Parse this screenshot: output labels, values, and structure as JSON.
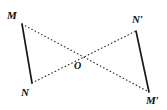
{
  "figure": {
    "background_color": "#ffffff",
    "stroke_color": "#1a1a1a",
    "width": 167,
    "height": 110,
    "labels": {
      "M": "M",
      "N": "N",
      "N_prime": "N′",
      "M_prime": "M′",
      "O": "O"
    },
    "points": {
      "M": {
        "x": 22,
        "y": 24
      },
      "N": {
        "x": 32,
        "y": 83
      },
      "N_prime": {
        "x": 136,
        "y": 31
      },
      "M_prime": {
        "x": 149,
        "y": 92
      },
      "O": {
        "x": 83,
        "y": 56
      }
    },
    "segments": [
      {
        "name": "segment-MN",
        "from": "M",
        "to": "N",
        "style": "solid",
        "width": 1.6
      },
      {
        "name": "segment-NpMp",
        "from": "N_prime",
        "to": "M_prime",
        "style": "solid",
        "width": 1.6
      },
      {
        "name": "segment-MMp",
        "from": "M",
        "to": "M_prime",
        "style": "dotted",
        "width": 1.1
      },
      {
        "name": "segment-NNp",
        "from": "N",
        "to": "N_prime",
        "style": "dotted",
        "width": 1.1
      }
    ]
  }
}
